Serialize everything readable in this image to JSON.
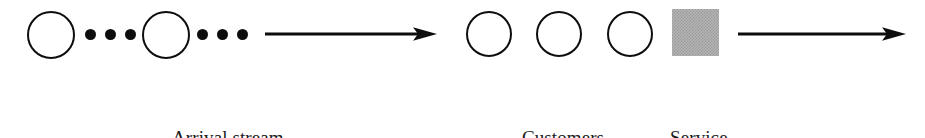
{
  "diagram": {
    "background_color": "#ffffff",
    "stroke_color": "#0d0d0d",
    "facility_fill_color": "#b4b4b4",
    "text_color": "#1a1a1a",
    "labels": {
      "arrival_stream": "Arrival stream",
      "customers_in_queue_line1": "Customers",
      "customers_in_queue_line2": "in queue",
      "service_facility_line1": "Service",
      "service_facility_line2": "facility"
    },
    "nodes": [
      {
        "name": "arrival-customer-1",
        "shape": "circle",
        "x": 27,
        "y": 11,
        "size": 48
      },
      {
        "name": "arrival-customer-2",
        "shape": "circle",
        "x": 142,
        "y": 11,
        "size": 48
      },
      {
        "name": "queue-customer-1",
        "shape": "circle",
        "x": 466,
        "y": 11,
        "size": 46
      },
      {
        "name": "queue-customer-2",
        "shape": "circle",
        "x": 536,
        "y": 11,
        "size": 46
      },
      {
        "name": "queue-customer-3",
        "shape": "circle",
        "x": 607,
        "y": 11,
        "size": 46
      },
      {
        "name": "service-facility",
        "shape": "square",
        "x": 672,
        "y": 9,
        "size": 47
      }
    ],
    "ellipsis_groups": [
      {
        "name": "arrival-ellipsis-left",
        "dots": [
          85,
          105,
          125
        ],
        "y": 29
      },
      {
        "name": "arrival-ellipsis-right",
        "dots": [
          197,
          217,
          237
        ],
        "y": 29
      }
    ],
    "arrows": [
      {
        "name": "arrival-flow-arrow",
        "x": 265,
        "y": 23,
        "length": 172,
        "direction": "right"
      },
      {
        "name": "departure-flow-arrow",
        "x": 738,
        "y": 23,
        "length": 168,
        "direction": "right"
      }
    ],
    "label_positions": [
      {
        "name": "arrival-stream-label",
        "x": 172,
        "y": 80
      },
      {
        "name": "customers-in-queue-label",
        "x": 508,
        "y": 80
      },
      {
        "name": "service-facility-label",
        "x": 670,
        "y": 80
      }
    ]
  }
}
